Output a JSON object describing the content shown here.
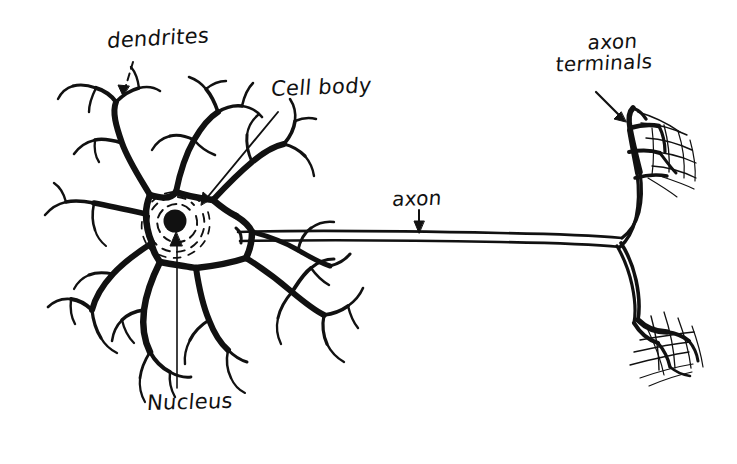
{
  "diagram": {
    "background_color": "#ffffff",
    "ink_color": "#111111",
    "labels": {
      "dendrites": "dendrites",
      "cell_body": "Cell body",
      "axon": "axon",
      "axon_terminals_line1": "axon",
      "axon_terminals_line2": "terminals",
      "nucleus": "Nucleus"
    },
    "parts": {
      "soma": "cell-body-soma",
      "nucleus": "nucleus-dot",
      "cytoplasm_rings": "concentric-dashed-rings",
      "dendrite_trees": "branching-dendrites",
      "axon": "long-axon-fiber",
      "axon_terminal_upper": "upper-terminal-tuft",
      "axon_terminal_lower": "lower-terminal-tuft"
    },
    "leaders": {
      "dendrites": "dashed-arrow-down-right",
      "cell_body": "straight-arrow-down-left",
      "axon": "short-vertical-arrow-down",
      "axon_terminals": "diagonal-arrow-down-right",
      "nucleus": "long-vertical-arrow-up"
    }
  }
}
